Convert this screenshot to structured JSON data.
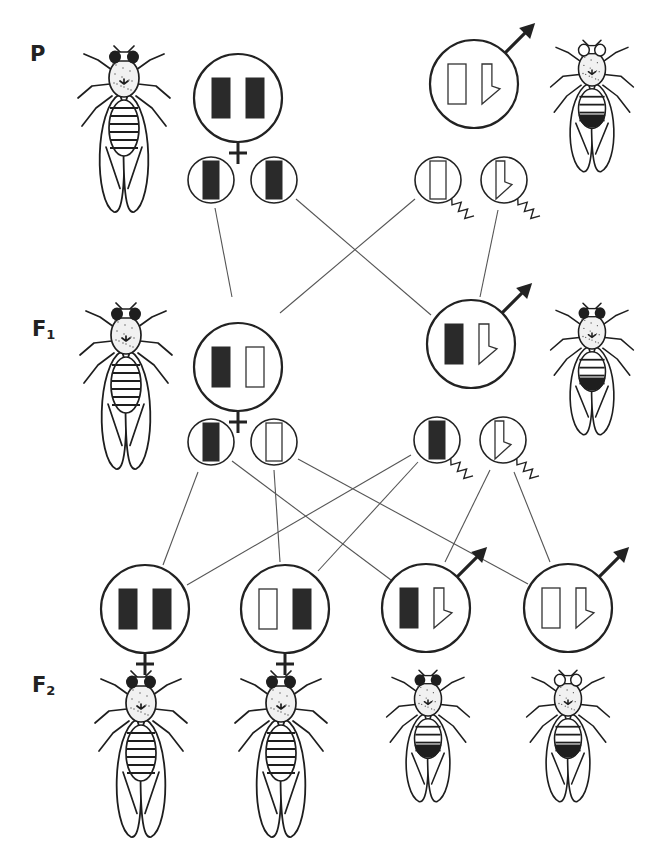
{
  "generations": [
    {
      "id": "P",
      "label": "P",
      "subscript": ""
    },
    {
      "id": "F1",
      "label": "F",
      "subscript": "1"
    },
    {
      "id": "F2",
      "label": "F",
      "subscript": "2"
    }
  ],
  "legend": {
    "x_red": "filled bar = X chromosome carrying red-eye allele",
    "x_white": "open bar = X chromosome carrying white-eye allele",
    "y": "hooked shape = Y chromosome",
    "female_symbol": "venus-symbol",
    "male_symbol": "mars-symbol",
    "sperm_tail": "squiggle tail = sperm",
    "colors": {
      "ink": "#222222",
      "line": "#555555",
      "background": "#ffffff"
    }
  },
  "individuals": [
    {
      "id": "P-female",
      "generation": "P",
      "sex": "female",
      "chromosomes": [
        "X-red",
        "X-red"
      ],
      "eye": "red",
      "cx": 238,
      "cy": 98,
      "r": 44
    },
    {
      "id": "P-male",
      "generation": "P",
      "sex": "male",
      "chromosomes": [
        "X-white",
        "Y"
      ],
      "eye": "white",
      "cx": 474,
      "cy": 84,
      "r": 44
    },
    {
      "id": "F1-female",
      "generation": "F1",
      "sex": "female",
      "chromosomes": [
        "X-red",
        "X-white"
      ],
      "eye": "red",
      "cx": 238,
      "cy": 367,
      "r": 44
    },
    {
      "id": "F1-male",
      "generation": "F1",
      "sex": "male",
      "chromosomes": [
        "X-red",
        "Y"
      ],
      "eye": "red",
      "cx": 471,
      "cy": 344,
      "r": 44
    },
    {
      "id": "F2-female-1",
      "generation": "F2",
      "sex": "female",
      "chromosomes": [
        "X-red",
        "X-red"
      ],
      "eye": "red",
      "cx": 145,
      "cy": 609,
      "r": 44
    },
    {
      "id": "F2-female-2",
      "generation": "F2",
      "sex": "female",
      "chromosomes": [
        "X-white",
        "X-red"
      ],
      "eye": "red",
      "cx": 285,
      "cy": 609,
      "r": 44
    },
    {
      "id": "F2-male-1",
      "generation": "F2",
      "sex": "male",
      "chromosomes": [
        "X-red",
        "Y"
      ],
      "eye": "red",
      "cx": 426,
      "cy": 608,
      "r": 44
    },
    {
      "id": "F2-male-2",
      "generation": "F2",
      "sex": "male",
      "chromosomes": [
        "X-white",
        "Y"
      ],
      "eye": "white",
      "cx": 568,
      "cy": 608,
      "r": 44
    }
  ],
  "gametes": [
    {
      "id": "P-egg-1",
      "type": "egg",
      "chromosome": "X-red",
      "cx": 211,
      "cy": 180,
      "r": 23
    },
    {
      "id": "P-egg-2",
      "type": "egg",
      "chromosome": "X-red",
      "cx": 274,
      "cy": 180,
      "r": 23
    },
    {
      "id": "P-sperm-1",
      "type": "sperm",
      "chromosome": "X-white",
      "cx": 438,
      "cy": 180,
      "r": 23
    },
    {
      "id": "P-sperm-2",
      "type": "sperm",
      "chromosome": "Y",
      "cx": 504,
      "cy": 180,
      "r": 23
    },
    {
      "id": "F1-egg-1",
      "type": "egg",
      "chromosome": "X-red",
      "cx": 211,
      "cy": 442,
      "r": 23
    },
    {
      "id": "F1-egg-2",
      "type": "egg",
      "chromosome": "X-white",
      "cx": 274,
      "cy": 442,
      "r": 23
    },
    {
      "id": "F1-sperm-1",
      "type": "sperm",
      "chromosome": "X-red",
      "cx": 437,
      "cy": 440,
      "r": 23
    },
    {
      "id": "F1-sperm-2",
      "type": "sperm",
      "chromosome": "Y",
      "cx": 503,
      "cy": 440,
      "r": 23
    }
  ],
  "connections": [
    {
      "from": "P-egg-1",
      "to": "F1-female",
      "x1": 215,
      "y1": 208,
      "x2": 232,
      "y2": 297
    },
    {
      "from": "P-egg-2",
      "to": "F1-male",
      "x1": 296,
      "y1": 199,
      "x2": 431,
      "y2": 315
    },
    {
      "from": "P-sperm-1",
      "to": "F1-female",
      "x1": 415,
      "y1": 199,
      "x2": 280,
      "y2": 313
    },
    {
      "from": "P-sperm-2",
      "to": "F1-male",
      "x1": 498,
      "y1": 210,
      "x2": 480,
      "y2": 297
    },
    {
      "from": "F1-egg-1",
      "to": "F2-female-1",
      "x1": 198,
      "y1": 472,
      "x2": 163,
      "y2": 565
    },
    {
      "from": "F1-egg-1",
      "to": "F2-male-1",
      "x1": 232,
      "y1": 461,
      "x2": 391,
      "y2": 580
    },
    {
      "from": "F1-egg-2",
      "to": "F2-female-2",
      "x1": 274,
      "y1": 470,
      "x2": 280,
      "y2": 562
    },
    {
      "from": "F1-egg-2",
      "to": "F2-male-2",
      "x1": 298,
      "y1": 459,
      "x2": 528,
      "y2": 584
    },
    {
      "from": "F1-sperm-1",
      "to": "F2-female-1",
      "x1": 411,
      "y1": 455,
      "x2": 187,
      "y2": 585
    },
    {
      "from": "F1-sperm-1",
      "to": "F2-female-2",
      "x1": 418,
      "y1": 462,
      "x2": 318,
      "y2": 571
    },
    {
      "from": "F1-sperm-2",
      "to": "F2-male-1",
      "x1": 490,
      "y1": 470,
      "x2": 445,
      "y2": 562
    },
    {
      "from": "F1-sperm-2",
      "to": "F2-male-2",
      "x1": 514,
      "y1": 472,
      "x2": 550,
      "y2": 562
    }
  ],
  "flies": [
    {
      "id": "fly-P-female",
      "sex": "female",
      "eye": "red",
      "x": 124,
      "y": 48,
      "scale": 1.0
    },
    {
      "id": "fly-P-male",
      "sex": "male",
      "eye": "white",
      "x": 592,
      "y": 42,
      "scale": 0.9
    },
    {
      "id": "fly-F1-female",
      "sex": "female",
      "eye": "red",
      "x": 126,
      "y": 305,
      "scale": 1.0
    },
    {
      "id": "fly-F1-male",
      "sex": "male",
      "eye": "red",
      "x": 592,
      "y": 305,
      "scale": 0.9
    },
    {
      "id": "fly-F2-female-1",
      "sex": "female",
      "eye": "red",
      "x": 141,
      "y": 673,
      "scale": 1.0
    },
    {
      "id": "fly-F2-female-2",
      "sex": "female",
      "eye": "red",
      "x": 281,
      "y": 673,
      "scale": 1.0
    },
    {
      "id": "fly-F2-male-1",
      "sex": "male",
      "eye": "red",
      "x": 428,
      "y": 672,
      "scale": 0.9
    },
    {
      "id": "fly-F2-male-2",
      "sex": "male",
      "eye": "white",
      "x": 568,
      "y": 672,
      "scale": 0.9
    }
  ],
  "label_positions": {
    "P": {
      "x": 30,
      "y": 42
    },
    "F1": {
      "x": 32,
      "y": 317
    },
    "F2": {
      "x": 32,
      "y": 673
    }
  }
}
